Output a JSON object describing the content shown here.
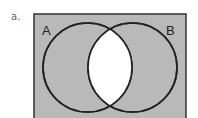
{
  "problem_label": "a.",
  "diagram": {
    "type": "venn",
    "sets": [
      {
        "label": "A",
        "cx": 87.5,
        "cy": 67.5,
        "r": 44.5
      },
      {
        "label": "B",
        "cx": 132.5,
        "cy": 67.5,
        "r": 44.5
      }
    ],
    "universe": {
      "x": 34,
      "y": 14,
      "width": 152,
      "height": 110
    },
    "shaded_region": "A only, B only, and outside both (complement of A ∩ B)",
    "colors": {
      "shade": "#b9b9b9",
      "stroke": "#222222",
      "unshaded": "#ffffff"
    }
  }
}
